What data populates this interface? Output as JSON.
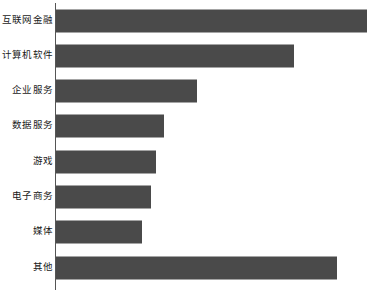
{
  "chart_data": {
    "type": "bar",
    "orientation": "horizontal",
    "title": "",
    "subtitle": "",
    "xlabel": "",
    "ylabel": "",
    "grid": false,
    "legend": false,
    "axis_tick_labels": [],
    "categories": [
      "互联网金融",
      "计算机软件",
      "企业服务",
      "数据服务",
      "游戏",
      "电子商务",
      "媒体",
      "其他"
    ],
    "values": [
      311,
      238,
      141,
      108,
      100,
      95,
      86,
      281
    ],
    "xlim": [
      0,
      320
    ],
    "bar_color": "#4a4a4a",
    "axis_color": "#555555",
    "background_color": "#ffffff"
  },
  "bars": [
    {
      "label": "互联网金融",
      "value": 311
    },
    {
      "label": "计算机软件",
      "value": 238
    },
    {
      "label": "企业服务",
      "value": 141
    },
    {
      "label": "数据服务",
      "value": 108
    },
    {
      "label": "游戏",
      "value": 100
    },
    {
      "label": "电子商务",
      "value": 95
    },
    {
      "label": "媒体",
      "value": 86
    },
    {
      "label": "其他",
      "value": 281
    }
  ]
}
